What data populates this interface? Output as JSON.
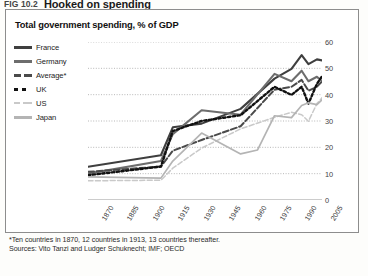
{
  "figure": {
    "number": "FIG 10.2",
    "title": "Hooked on spending"
  },
  "chart_subtitle": "Total government spending, % of GDP",
  "legend": {
    "position": "top-left",
    "items": [
      {
        "label": "France",
        "key": "k-solid-dark",
        "color": "#3f3f3f"
      },
      {
        "label": "Germany",
        "key": "k-solid-mid",
        "color": "#6d6d6d"
      },
      {
        "label": "Average*",
        "key": "k-dash",
        "color": "#4a4a4a"
      },
      {
        "label": "UK",
        "key": "k-dot",
        "color": "#111111"
      },
      {
        "label": "US",
        "key": "k-us",
        "color": "#c9c9c9"
      },
      {
        "label": "Japan",
        "key": "k-japan",
        "color": "#b4b4b4"
      }
    ]
  },
  "footnote": {
    "line1": "*Ten countries in 1870, 12 countries in 1913, 13 countries thereafter.",
    "line2": "Sources: Vito Tanzi and Ludger Schuknecht; IMF; OECD"
  },
  "chart_data": {
    "type": "line",
    "title": "Total government spending, % of GDP",
    "xlabel": "",
    "ylabel": "% of GDP",
    "xlim": [
      1870,
      2008
    ],
    "ylim": [
      0,
      60
    ],
    "yticks": [
      0,
      10,
      20,
      30,
      40,
      50,
      60
    ],
    "xticks": [
      1870,
      1885,
      1900,
      1915,
      1930,
      1945,
      1960,
      1975,
      1990,
      2005
    ],
    "grid": "horizontal-dotted",
    "legend_position": "top-left",
    "axis_side": "right",
    "series": [
      {
        "name": "France",
        "style": "solid",
        "color": "#3f3f3f",
        "x": [
          1870,
          1913,
          1920,
          1937,
          1960,
          1980,
          1990,
          1996,
          2000,
          2005,
          2008
        ],
        "y": [
          12.6,
          17.0,
          27.6,
          29.0,
          34.6,
          46.1,
          49.8,
          55.0,
          51.6,
          53.4,
          53.0
        ]
      },
      {
        "name": "Germany",
        "style": "solid",
        "color": "#6d6d6d",
        "x": [
          1870,
          1913,
          1920,
          1937,
          1960,
          1980,
          1990,
          1996,
          2000,
          2005,
          2008
        ],
        "y": [
          10.0,
          14.8,
          25.0,
          34.1,
          32.4,
          47.9,
          45.1,
          49.1,
          45.1,
          46.8,
          45.0
        ]
      },
      {
        "name": "Average*",
        "style": "dashed",
        "color": "#4a4a4a",
        "x": [
          1870,
          1913,
          1920,
          1937,
          1960,
          1980,
          1990,
          1996,
          2000,
          2005,
          2008
        ],
        "y": [
          10.7,
          12.7,
          18.7,
          22.8,
          28.0,
          41.9,
          43.0,
          45.6,
          41.5,
          43.0,
          45.0
        ]
      },
      {
        "name": "UK",
        "style": "dotted",
        "color": "#111111",
        "x": [
          1870,
          1913,
          1920,
          1937,
          1960,
          1980,
          1990,
          1996,
          2000,
          2005,
          2008
        ],
        "y": [
          9.4,
          12.7,
          26.2,
          30.0,
          32.2,
          43.0,
          39.9,
          43.0,
          36.6,
          44.1,
          47.0
        ]
      },
      {
        "name": "US",
        "style": "dashed-light",
        "color": "#c9c9c9",
        "x": [
          1870,
          1913,
          1920,
          1937,
          1960,
          1980,
          1990,
          1996,
          2000,
          2005,
          2008
        ],
        "y": [
          7.3,
          7.5,
          12.1,
          19.7,
          27.0,
          31.4,
          33.3,
          32.4,
          29.9,
          36.6,
          38.8
        ]
      },
      {
        "name": "Japan",
        "style": "solid-light",
        "color": "#b4b4b4",
        "x": [
          1870,
          1913,
          1920,
          1937,
          1960,
          1970,
          1980,
          1990,
          1996,
          2000,
          2005,
          2008
        ],
        "y": [
          8.8,
          8.3,
          14.8,
          25.4,
          17.5,
          19.0,
          32.0,
          31.3,
          35.9,
          36.9,
          36.2,
          38.0
        ]
      }
    ]
  }
}
